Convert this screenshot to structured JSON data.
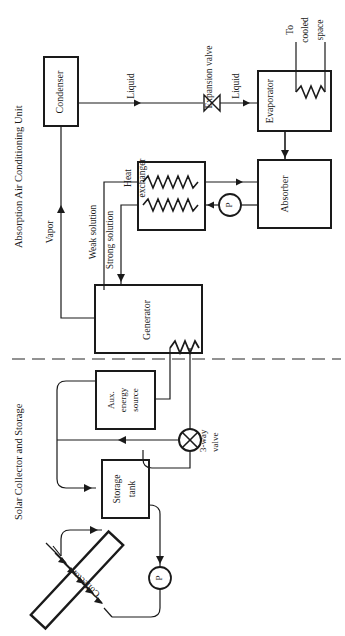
{
  "diagram": {
    "orientation": "rotated-90-ccw",
    "sections": [
      {
        "id": "absorption",
        "label": "Absorption Air Conditioning Unit"
      },
      {
        "id": "solar",
        "label": "Solar Collector and Storage"
      }
    ],
    "divider": "dashed-separator"
  },
  "components": {
    "condenser": "Condenser",
    "evaporator": "Evaporator",
    "absorber": "Absorber",
    "heat_exchanger_line1": "Heat",
    "heat_exchanger_line2": "exchanger",
    "generator": "Generator",
    "expansion_valve": "Expansion valve",
    "aux_line1": "Aux.",
    "aux_line2": "energy",
    "aux_line3": "source",
    "storage_line1": "Storage",
    "storage_line2": "tank",
    "collector": "Collector",
    "three_way_line1": "3-way",
    "three_way_line2": "valve",
    "pump_symbol": "P"
  },
  "stream_labels": {
    "vapor": "Vapor",
    "liquid_from_condenser": "Liquid",
    "liquid_to_evaporator": "Liquid",
    "weak_solution": "Weak solution",
    "strong_solution": "Strong solution",
    "cooled_space_line1": "To",
    "cooled_space_line2": "cooled",
    "cooled_space_line3": "space"
  },
  "colors": {
    "background": "#ffffff",
    "stroke": "#1a1a1a",
    "text": "#1a1a1a",
    "divider": "#6f6f6f"
  }
}
